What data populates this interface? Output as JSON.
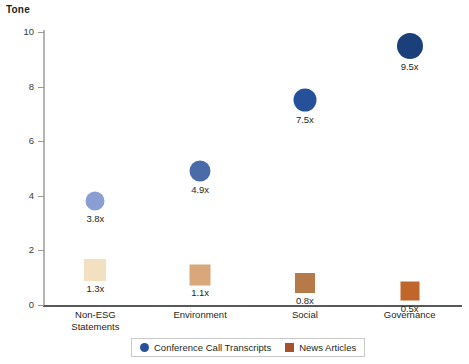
{
  "chart_data": {
    "type": "scatter",
    "title": "Tone",
    "xlabel": "",
    "ylabel": "Tone",
    "ylim": [
      0,
      10
    ],
    "yticks": [
      "0",
      "2",
      "4",
      "6",
      "8",
      "10"
    ],
    "grid": false,
    "legend_position": "bottom",
    "categories": [
      "Non-ESG\nStatements",
      "Environment",
      "Social",
      "Governance"
    ],
    "series": [
      {
        "name": "Conference Call Transcripts",
        "marker": "circle",
        "values": [
          3.8,
          4.9,
          7.5,
          9.5
        ],
        "labels": [
          "3.8x",
          "4.9x",
          "7.5x",
          "9.5x"
        ],
        "colors": [
          "#8b9ed4",
          "#4a6ba8",
          "#27509a",
          "#1b3f7a"
        ],
        "sizes": [
          19,
          21,
          23,
          26
        ]
      },
      {
        "name": "News Articles",
        "marker": "square",
        "values": [
          1.3,
          1.1,
          0.8,
          0.5
        ],
        "labels": [
          "1.3x",
          "1.1x",
          "0.8x",
          "0.5x"
        ],
        "colors": [
          "#f2e0c0",
          "#d8a87a",
          "#b5794a",
          "#c0662a"
        ],
        "sizes": [
          22,
          21,
          20,
          19
        ]
      }
    ]
  },
  "legend": {
    "items": [
      {
        "label": "Conference Call Transcripts",
        "color": "#27509a",
        "marker": "circle"
      },
      {
        "label": "News Articles",
        "color": "#a6522c",
        "marker": "square"
      }
    ]
  }
}
